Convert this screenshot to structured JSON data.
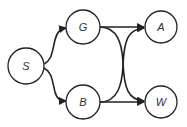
{
  "diagram": {
    "type": "directed-graph",
    "nodes": [
      {
        "id": "S",
        "label": "S"
      },
      {
        "id": "G",
        "label": "G"
      },
      {
        "id": "B",
        "label": "B"
      },
      {
        "id": "A",
        "label": "A"
      },
      {
        "id": "W",
        "label": "W"
      }
    ],
    "edges": [
      {
        "from": "S",
        "to": "G"
      },
      {
        "from": "S",
        "to": "B"
      },
      {
        "from": "G",
        "to": "A"
      },
      {
        "from": "G",
        "to": "W"
      },
      {
        "from": "B",
        "to": "A"
      },
      {
        "from": "B",
        "to": "W"
      }
    ]
  }
}
